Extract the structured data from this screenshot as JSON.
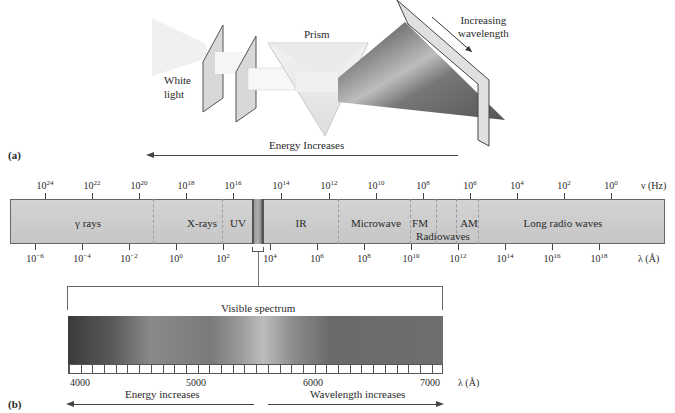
{
  "panel_a": {
    "label": "(a)",
    "white_light_label": [
      "White",
      "light"
    ],
    "prism_label": "Prism",
    "increasing_wavelength_label": [
      "Increasing",
      "wavelength"
    ],
    "energy_arrow_label": "Energy Increases"
  },
  "spectrum": {
    "frequency_axis_label": "ν (Hz)",
    "wavelength_axis_label": "λ (Å)",
    "frequency_ticks": [
      {
        "base": "10",
        "exp": "24",
        "x": 45
      },
      {
        "base": "10",
        "exp": "22",
        "x": 92
      },
      {
        "base": "10",
        "exp": "20",
        "x": 139
      },
      {
        "base": "10",
        "exp": "18",
        "x": 186
      },
      {
        "base": "10",
        "exp": "16",
        "x": 233
      },
      {
        "base": "10",
        "exp": "14",
        "x": 281
      },
      {
        "base": "10",
        "exp": "12",
        "x": 329
      },
      {
        "base": "10",
        "exp": "10",
        "x": 376
      },
      {
        "base": "10",
        "exp": "8",
        "x": 423
      },
      {
        "base": "10",
        "exp": "6",
        "x": 470
      },
      {
        "base": "10",
        "exp": "4",
        "x": 517
      },
      {
        "base": "10",
        "exp": "2",
        "x": 564
      },
      {
        "base": "10",
        "exp": "0",
        "x": 611
      }
    ],
    "wavelength_ticks": [
      {
        "base": "10",
        "exp": "−6",
        "x": 35
      },
      {
        "base": "10",
        "exp": "−4",
        "x": 82
      },
      {
        "base": "10",
        "exp": "−2",
        "x": 129
      },
      {
        "base": "10",
        "exp": "0",
        "x": 176
      },
      {
        "base": "10",
        "exp": "2",
        "x": 223
      },
      {
        "base": "10",
        "exp": "4",
        "x": 270
      },
      {
        "base": "10",
        "exp": "6",
        "x": 317
      },
      {
        "base": "10",
        "exp": "8",
        "x": 364
      },
      {
        "base": "10",
        "exp": "10",
        "x": 411
      },
      {
        "base": "10",
        "exp": "12",
        "x": 458
      },
      {
        "base": "10",
        "exp": "14",
        "x": 505
      },
      {
        "base": "10",
        "exp": "16",
        "x": 552
      },
      {
        "base": "10",
        "exp": "18",
        "x": 599
      }
    ],
    "regions": [
      {
        "name": "γ rays",
        "x": 88
      },
      {
        "name": "X-rays",
        "x": 202
      },
      {
        "name": "UV",
        "x": 238
      },
      {
        "name": "IR",
        "x": 301
      },
      {
        "name": "Microwave",
        "x": 376
      },
      {
        "name": "FM",
        "x": 420
      },
      {
        "name": "AM",
        "x": 469
      },
      {
        "name": "Long radio waves",
        "x": 563
      }
    ],
    "radiowaves_label": "Radiowaves",
    "divider_positions": [
      153,
      222,
      337,
      410,
      436,
      456,
      478
    ]
  },
  "panel_b": {
    "label": "(b)",
    "visible_title": "Visible spectrum",
    "ruler_ticks": [
      {
        "label": "4000",
        "x": 80
      },
      {
        "label": "5000",
        "x": 196
      },
      {
        "label": "6000",
        "x": 313
      },
      {
        "label": "7000",
        "x": 430
      }
    ],
    "wavelength_axis_label": "λ (Å)",
    "energy_arrow_label": "Energy increases",
    "wavelength_arrow_label": "Wavelength increases"
  }
}
